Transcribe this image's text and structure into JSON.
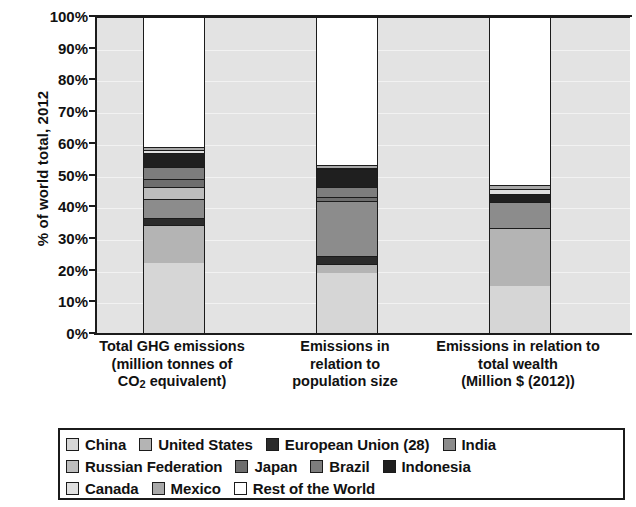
{
  "chart_data": {
    "type": "bar",
    "title": "",
    "subtitle": "",
    "stacked": true,
    "ylabel": "% of world total, 2012",
    "xlabel": "",
    "ylim": [
      0,
      100
    ],
    "grid": true,
    "legend_position": "bottom",
    "ytick_labels": [
      "100%",
      "90%",
      "80%",
      "70%",
      "60%",
      "50%",
      "40%",
      "30%",
      "20%",
      "10%",
      "0%"
    ],
    "ytick_values": [
      100,
      90,
      80,
      70,
      60,
      50,
      40,
      30,
      20,
      10,
      0
    ],
    "categories": [
      "Total GHG emissions (million tonnes of CO2 equivalent)",
      "Emissions in relation to population size",
      "Emissions in relation to total wealth (Million $ (2012))"
    ],
    "category_label_lines": [
      [
        "Total GHG emissions",
        "(million tonnes of",
        "CO",
        "2",
        " equivalent)"
      ],
      [
        "Emissions in",
        "relation to",
        "population size"
      ],
      [
        "Emissions in relation to",
        "total wealth",
        "(Million $ (2012))"
      ]
    ],
    "series": [
      {
        "name": "China",
        "color": "#d6d6d6",
        "values": [
          22.0,
          19.0,
          14.8
        ]
      },
      {
        "name": "United States",
        "color": "#b4b4b4",
        "values": [
          12.3,
          2.8,
          18.4
        ]
      },
      {
        "name": "European Union (28)",
        "color": "#2b2b2b",
        "values": [
          2.2,
          2.5,
          0.0
        ]
      },
      {
        "name": "India",
        "color": "#8c8c8c",
        "values": [
          6.0,
          17.4,
          8.2
        ]
      },
      {
        "name": "Russian Federation",
        "color": "#bdbdbd",
        "values": [
          3.8,
          0.0,
          0.0
        ]
      },
      {
        "name": "Japan",
        "color": "#6e6e6e",
        "values": [
          2.5,
          1.3,
          0.0
        ]
      },
      {
        "name": "Brazil",
        "color": "#7d7d7d",
        "values": [
          3.6,
          3.2,
          0.0
        ]
      },
      {
        "name": "Indonesia",
        "color": "#1f1f1f",
        "values": [
          4.6,
          5.6,
          2.5
        ]
      },
      {
        "name": "Canada",
        "color": "#e0e0e0",
        "values": [
          0.8,
          0.5,
          1.7
        ]
      },
      {
        "name": "Mexico",
        "color": "#a8a8a8",
        "values": [
          1.2,
          1.0,
          1.2
        ]
      },
      {
        "name": "Rest of the World",
        "color": "#ffffff",
        "values": [
          41.0,
          46.7,
          53.2
        ]
      }
    ],
    "stack_tops": [
      67.0,
      60.6,
      75.5
    ],
    "plot_background": "#e3e3e3",
    "axis_color": "#1b1b1b"
  },
  "legend": {
    "rows": [
      [
        "China",
        "United States",
        "European Union (28)",
        "India"
      ],
      [
        "Russian Federation",
        "Japan",
        "Brazil",
        "Indonesia"
      ],
      [
        "Canada",
        "Mexico",
        "Rest of the World"
      ]
    ]
  }
}
